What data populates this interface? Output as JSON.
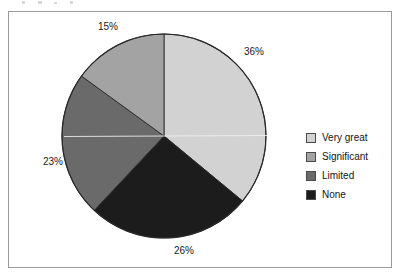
{
  "chart_data": {
    "type": "pie",
    "title": "",
    "subtitle": "",
    "xlabel": "",
    "ylabel": "",
    "grid": false,
    "legend_position": "right",
    "start_angle_deg": 0,
    "direction": "clockwise",
    "categories": [
      "Very great",
      "Significant",
      "Limited",
      "None"
    ],
    "values": [
      36,
      23,
      15,
      26
    ],
    "unit": "%",
    "slices": [
      {
        "label": "Very great",
        "value": 36,
        "display": "36%",
        "color": "#d2d2d2",
        "start_deg": 0,
        "end_deg": 129.6
      },
      {
        "label": "None",
        "value": 26,
        "display": "26%",
        "color": "#1c1c1c",
        "start_deg": 129.6,
        "end_deg": 223.2
      },
      {
        "label": "Limited",
        "value": 23,
        "display": "23%",
        "color": "#6a6a6a",
        "start_deg": 223.2,
        "end_deg": 306.0
      },
      {
        "label": "Significant",
        "value": 15,
        "display": "15%",
        "color": "#a3a3a3",
        "start_deg": 306.0,
        "end_deg": 360.0
      }
    ],
    "data_labels": [
      {
        "text": "15%",
        "x": 97,
        "y": 21
      },
      {
        "text": "36%",
        "x": 243,
        "y": 46
      },
      {
        "text": "23%",
        "x": 42,
        "y": 156
      },
      {
        "text": "26%",
        "x": 173,
        "y": 245
      }
    ]
  },
  "legend": {
    "items": [
      {
        "label": "Very great",
        "color": "#d2d2d2"
      },
      {
        "label": "Significant",
        "color": "#a3a3a3"
      },
      {
        "label": "Limited",
        "color": "#6a6a6a"
      },
      {
        "label": "None",
        "color": "#1c1c1c"
      }
    ]
  },
  "frame": {
    "border_color": "#9a9a9a",
    "background": "#ffffff"
  },
  "pie": {
    "center_x": 163,
    "center_y": 135,
    "radius": 102,
    "outline_color": "#2a2a2a"
  }
}
